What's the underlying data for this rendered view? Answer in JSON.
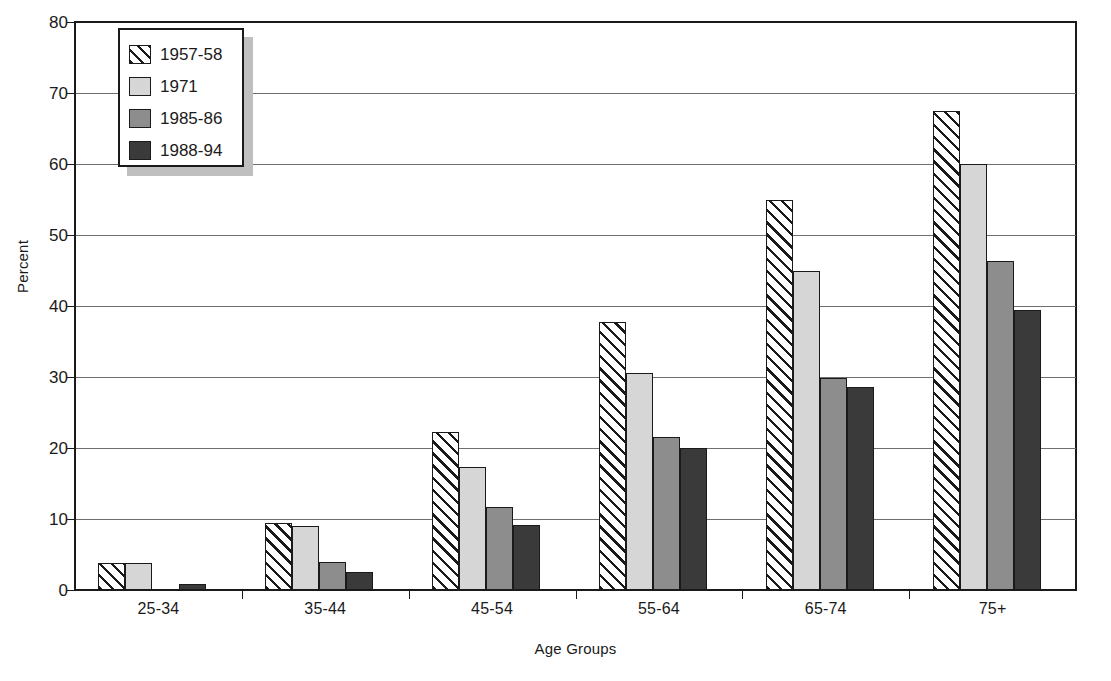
{
  "chart_data": {
    "type": "bar",
    "title": "",
    "xlabel": "Age Groups",
    "ylabel": "Percent",
    "categories": [
      "25-34",
      "35-44",
      "45-54",
      "55-64",
      "65-74",
      "75+"
    ],
    "series": [
      {
        "name": "1957-58",
        "values": [
          3.8,
          9.5,
          22.2,
          37.7,
          55.0,
          67.5
        ]
      },
      {
        "name": "1971",
        "values": [
          3.8,
          9.0,
          17.3,
          30.6,
          45.0,
          60.0
        ]
      },
      {
        "name": "1985-86",
        "values": [
          0.0,
          3.9,
          11.7,
          21.5,
          29.8,
          46.3
        ]
      },
      {
        "name": "1988-94",
        "values": [
          0.8,
          2.6,
          9.1,
          20.0,
          28.6,
          39.5
        ]
      }
    ],
    "ylim": [
      0,
      80
    ],
    "ytick_values": [
      0,
      10,
      20,
      30,
      40,
      50,
      60,
      70,
      80
    ],
    "ytick_labels": [
      "0",
      "10",
      "20",
      "30",
      "40",
      "50",
      "60",
      "70",
      "80"
    ],
    "grid": true,
    "legend_position": "top-left",
    "colors": {
      "series_1957_58": "#ffffff",
      "series_1971": "#d6d6d6",
      "series_1985_86": "#8d8d8d",
      "series_1988_94": "#3a3a3a",
      "axis": "#1a1a1a",
      "gridline": "#6e6e6e",
      "background": "#ffffff",
      "legend_shadow": "#bfbfbf"
    }
  }
}
